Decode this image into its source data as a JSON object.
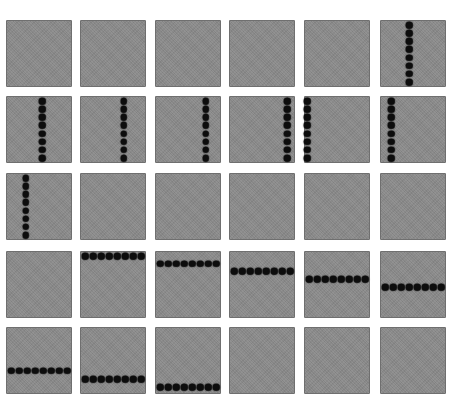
{
  "grid": {
    "rows": 5,
    "cols": 6,
    "tile_color": "#8a8a8a",
    "dot_color": "#0d0d0d",
    "dots_per_line": 8,
    "tiles": [
      {
        "row": 1,
        "col": 1,
        "line": null
      },
      {
        "row": 1,
        "col": 2,
        "line": null
      },
      {
        "row": 1,
        "col": 3,
        "line": null
      },
      {
        "row": 1,
        "col": 4,
        "line": null
      },
      {
        "row": 1,
        "col": 5,
        "line": null
      },
      {
        "row": 1,
        "col": 6,
        "line": {
          "orientation": "vertical",
          "position": 0.44
        }
      },
      {
        "row": 2,
        "col": 1,
        "line": {
          "orientation": "vertical",
          "position": 0.55
        }
      },
      {
        "row": 2,
        "col": 2,
        "line": {
          "orientation": "vertical",
          "position": 0.66
        }
      },
      {
        "row": 2,
        "col": 3,
        "line": {
          "orientation": "vertical",
          "position": 0.77
        }
      },
      {
        "row": 2,
        "col": 4,
        "line": {
          "orientation": "vertical",
          "position": 0.88
        }
      },
      {
        "row": 2,
        "col": 5,
        "line": {
          "orientation": "vertical",
          "position": 0.05
        }
      },
      {
        "row": 2,
        "col": 6,
        "line": {
          "orientation": "vertical",
          "position": 0.17
        }
      },
      {
        "row": 3,
        "col": 1,
        "line": {
          "orientation": "vertical",
          "position": 0.3
        }
      },
      {
        "row": 3,
        "col": 2,
        "line": null
      },
      {
        "row": 3,
        "col": 3,
        "line": null
      },
      {
        "row": 3,
        "col": 4,
        "line": null
      },
      {
        "row": 3,
        "col": 5,
        "line": null
      },
      {
        "row": 3,
        "col": 6,
        "line": null
      },
      {
        "row": 4,
        "col": 1,
        "line": null
      },
      {
        "row": 4,
        "col": 2,
        "line": {
          "orientation": "horizontal",
          "position": 0.08
        }
      },
      {
        "row": 4,
        "col": 3,
        "line": {
          "orientation": "horizontal",
          "position": 0.19
        }
      },
      {
        "row": 4,
        "col": 4,
        "line": {
          "orientation": "horizontal",
          "position": 0.3
        }
      },
      {
        "row": 4,
        "col": 5,
        "line": {
          "orientation": "horizontal",
          "position": 0.42
        }
      },
      {
        "row": 4,
        "col": 6,
        "line": {
          "orientation": "horizontal",
          "position": 0.54
        }
      },
      {
        "row": 5,
        "col": 1,
        "line": {
          "orientation": "horizontal",
          "position": 0.65
        }
      },
      {
        "row": 5,
        "col": 2,
        "line": {
          "orientation": "horizontal",
          "position": 0.78
        }
      },
      {
        "row": 5,
        "col": 3,
        "line": {
          "orientation": "horizontal",
          "position": 0.9
        }
      },
      {
        "row": 5,
        "col": 4,
        "line": null
      },
      {
        "row": 5,
        "col": 5,
        "line": null
      },
      {
        "row": 5,
        "col": 6,
        "line": null
      }
    ]
  }
}
